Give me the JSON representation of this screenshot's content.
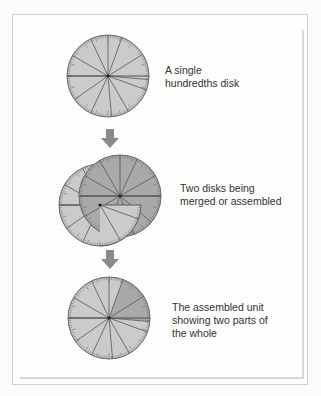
{
  "figure": {
    "steps": [
      {
        "id": "single",
        "caption_lines": [
          "A single",
          "hundredths disk"
        ]
      },
      {
        "id": "merged",
        "caption_lines": [
          "Two disks being",
          "merged or assembled"
        ]
      },
      {
        "id": "assembled",
        "caption_lines": [
          "The assembled unit",
          "showing two parts of",
          "the whole"
        ]
      }
    ],
    "arrow_icon": "down-arrow-icon",
    "colors": {
      "disk_light": "#cbcbcb",
      "disk_dark": "#a9a9a9",
      "arrow": "#8a8a8a",
      "caption_text": "#333333",
      "frame": "#cfcfcf"
    }
  }
}
